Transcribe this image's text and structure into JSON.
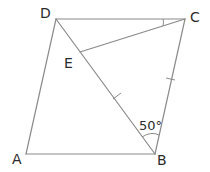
{
  "diagram": {
    "type": "geometry",
    "shape": "quadrilateral ABCD with point E on diagonal DB",
    "vertices": {
      "A": {
        "label": "A",
        "x": 26,
        "y": 154
      },
      "B": {
        "label": "B",
        "x": 155,
        "y": 154
      },
      "C": {
        "label": "C",
        "x": 185,
        "y": 19
      },
      "D": {
        "label": "D",
        "x": 56,
        "y": 19
      },
      "E": {
        "label": "E",
        "x": 80,
        "y": 52
      }
    },
    "segments": [
      "AB",
      "BC",
      "CD",
      "DA",
      "DB",
      "EC"
    ],
    "equal_length_marks": [
      "EB",
      "CB"
    ],
    "angle_marks": [
      {
        "vertex": "B",
        "between": [
          "BD",
          "BC"
        ],
        "label": "50°"
      },
      {
        "vertex": "C",
        "between": [
          "CD",
          "CE"
        ],
        "label": ""
      }
    ],
    "labels": {
      "A": "A",
      "B": "B",
      "C": "C",
      "D": "D",
      "E": "E",
      "angle_B": "50°"
    },
    "colors": {
      "line": "#8a8a8a",
      "text": "#2b2b2b",
      "background": "#ffffff"
    }
  }
}
